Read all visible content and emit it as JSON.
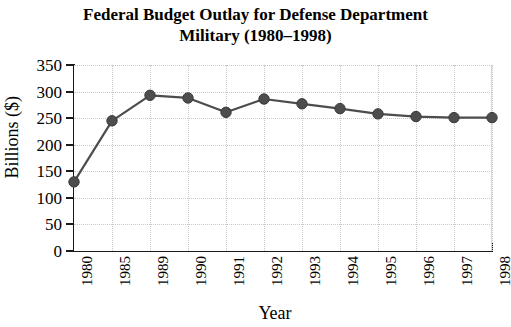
{
  "chart_data": {
    "type": "line",
    "title": "Federal Budget Outlay for Defense Department Military (1980–1998)",
    "title_lines": [
      "Federal Budget Outlay for Defense Department",
      "Military (1980–1998)"
    ],
    "xlabel": "Year",
    "ylabel": "Billions ($)",
    "categories": [
      "1980",
      "1985",
      "1989",
      "1990",
      "1991",
      "1992",
      "1993",
      "1994",
      "1995",
      "1996",
      "1997",
      "1998"
    ],
    "values": [
      130,
      245,
      293,
      288,
      261,
      286,
      277,
      268,
      258,
      253,
      251,
      251
    ],
    "ylim": [
      0,
      350
    ],
    "ytick_labels": [
      "0",
      "50",
      "100",
      "150",
      "200",
      "250",
      "300",
      "350"
    ],
    "ytick_values": [
      0,
      50,
      100,
      150,
      200,
      250,
      300,
      350
    ],
    "grid": true,
    "legend": "none",
    "series_name": "Defense outlay",
    "marker": "circle",
    "marker_color": "#4d4d4d",
    "line_color": "#4d4d4d",
    "grid_color": "#c8c8c8",
    "axis_color": "#1a1a1a",
    "background_color": "#ffffff"
  }
}
